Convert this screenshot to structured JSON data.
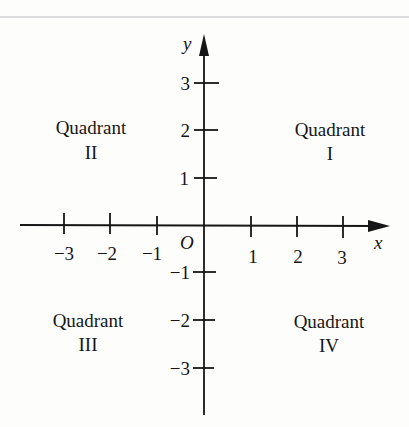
{
  "diagram": {
    "type": "cartesian-plane",
    "axes": {
      "x_label": "x",
      "y_label": "y",
      "origin_label": "O",
      "x_ticks": [
        "−3",
        "−2",
        "−1",
        "1",
        "2",
        "3"
      ],
      "y_ticks": [
        "3",
        "2",
        "1",
        "−1",
        "−2",
        "−3"
      ]
    },
    "quadrants": [
      {
        "word": "Quadrant",
        "numeral": "I"
      },
      {
        "word": "Quadrant",
        "numeral": "II"
      },
      {
        "word": "Quadrant",
        "numeral": "III"
      },
      {
        "word": "Quadrant",
        "numeral": "IV"
      }
    ],
    "colors": {
      "ink": "#161616",
      "paper": "#fdfdfb"
    }
  }
}
